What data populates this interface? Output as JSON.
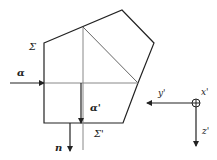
{
  "diagram": {
    "type": "prism-ray-geometry",
    "stroke_color": "#222222",
    "guide_color": "#888888",
    "labels": {
      "sigma": "Σ",
      "sigma_prime": "Σ'",
      "alpha": "α",
      "alpha_prime": "α'",
      "n": "n",
      "x_prime": "x'",
      "y_prime": "y'",
      "z_prime": "z'"
    },
    "axes_symbol": "circled-plus (x' into page)"
  }
}
